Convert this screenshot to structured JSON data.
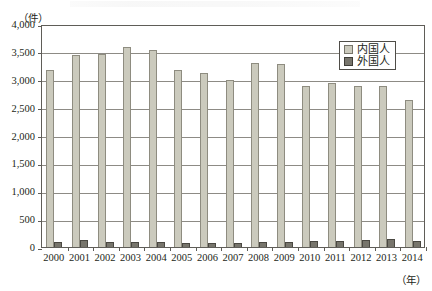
{
  "chart_data": {
    "type": "bar",
    "title": "",
    "xlabel": "(年)",
    "ylabel": "(件)",
    "ylim": [
      0,
      4000
    ],
    "ytick_step": 500,
    "ytick_labels": [
      "4,000",
      "3,500",
      "3,000",
      "2,500",
      "2,000",
      "1,500",
      "1,000",
      "500",
      "0"
    ],
    "ytick_values": [
      4000,
      3500,
      3000,
      2500,
      2000,
      1500,
      1000,
      500,
      0
    ],
    "grid": true,
    "legend_position": "top-right",
    "categories": [
      "2000",
      "2001",
      "2002",
      "2003",
      "2004",
      "2005",
      "2006",
      "2007",
      "2008",
      "2009",
      "2010",
      "2011",
      "2012",
      "2013",
      "2014"
    ],
    "series": [
      {
        "name": "内国人",
        "color": "#cbcabd",
        "values": [
          3180,
          3440,
          3470,
          3580,
          3530,
          3170,
          3130,
          3000,
          3300,
          3290,
          2890,
          2950,
          2880,
          2880,
          2640
        ]
      },
      {
        "name": "外国人",
        "color": "#77756c",
        "values": [
          90,
          120,
          95,
          90,
          85,
          80,
          80,
          75,
          85,
          85,
          100,
          115,
          125,
          140,
          110
        ]
      }
    ]
  },
  "legend": {
    "items": [
      {
        "label": "内国人"
      },
      {
        "label": "外国人"
      }
    ]
  },
  "axes": {
    "y_unit": "（件）",
    "x_unit": "（年）"
  }
}
